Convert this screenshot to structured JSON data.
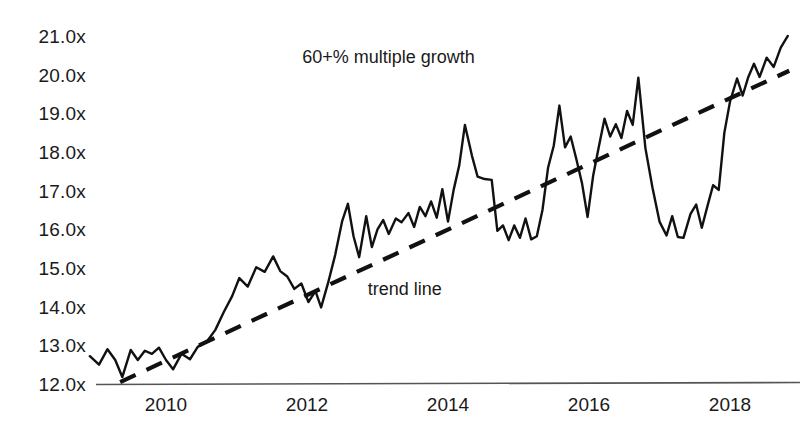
{
  "chart_data": {
    "type": "line",
    "title": "",
    "subtitle": "",
    "xlabel": "",
    "ylabel": "",
    "xlim": [
      2008.9,
      2018.95
    ],
    "ylim": [
      12.0,
      21.3
    ],
    "grid": false,
    "legend_position": "none",
    "y_tick_labels": [
      "21.0x",
      "20.0x",
      "19.0x",
      "18.0x",
      "17.0x",
      "16.0x",
      "15.0x",
      "14.0x",
      "13.0x",
      "12.0x"
    ],
    "y_tick_values": [
      21.0,
      20.0,
      19.0,
      18.0,
      17.0,
      16.0,
      15.0,
      14.0,
      13.0,
      12.0
    ],
    "x_tick_labels": [
      "2010",
      "2012",
      "2014",
      "2016",
      "2018"
    ],
    "x_tick_values": [
      2010,
      2012,
      2014,
      2016,
      2018
    ],
    "annotations": [
      {
        "name": "growth-annotation",
        "text": "60+% multiple growth",
        "x": 2013.35,
        "y": 20.45
      },
      {
        "name": "trendline-annotation",
        "text": "trend line",
        "x": 2013.5,
        "y": 14.45
      }
    ],
    "series": [
      {
        "name": "multiple",
        "style": "solid",
        "color": "#111111",
        "points": [
          [
            2008.92,
            12.72
          ],
          [
            2009.05,
            12.5
          ],
          [
            2009.17,
            12.9
          ],
          [
            2009.28,
            12.62
          ],
          [
            2009.38,
            12.18
          ],
          [
            2009.5,
            12.88
          ],
          [
            2009.6,
            12.62
          ],
          [
            2009.7,
            12.86
          ],
          [
            2009.8,
            12.78
          ],
          [
            2009.9,
            12.94
          ],
          [
            2010.0,
            12.62
          ],
          [
            2010.1,
            12.38
          ],
          [
            2010.22,
            12.78
          ],
          [
            2010.34,
            12.64
          ],
          [
            2010.45,
            12.96
          ],
          [
            2010.58,
            13.1
          ],
          [
            2010.7,
            13.4
          ],
          [
            2010.82,
            13.86
          ],
          [
            2010.94,
            14.28
          ],
          [
            2011.04,
            14.74
          ],
          [
            2011.16,
            14.52
          ],
          [
            2011.28,
            15.02
          ],
          [
            2011.4,
            14.9
          ],
          [
            2011.52,
            15.3
          ],
          [
            2011.62,
            14.92
          ],
          [
            2011.72,
            14.78
          ],
          [
            2011.82,
            14.46
          ],
          [
            2011.92,
            14.6
          ],
          [
            2012.02,
            14.12
          ],
          [
            2012.12,
            14.4
          ],
          [
            2012.2,
            13.98
          ],
          [
            2012.3,
            14.62
          ],
          [
            2012.4,
            15.34
          ],
          [
            2012.5,
            16.22
          ],
          [
            2012.58,
            16.66
          ],
          [
            2012.66,
            15.82
          ],
          [
            2012.74,
            15.28
          ],
          [
            2012.84,
            16.34
          ],
          [
            2012.92,
            15.54
          ],
          [
            2013.0,
            16.0
          ],
          [
            2013.08,
            16.24
          ],
          [
            2013.16,
            15.88
          ],
          [
            2013.26,
            16.28
          ],
          [
            2013.34,
            16.18
          ],
          [
            2013.44,
            16.42
          ],
          [
            2013.52,
            16.06
          ],
          [
            2013.6,
            16.58
          ],
          [
            2013.68,
            16.34
          ],
          [
            2013.76,
            16.72
          ],
          [
            2013.84,
            16.3
          ],
          [
            2013.92,
            17.04
          ],
          [
            2014.0,
            16.2
          ],
          [
            2014.08,
            17.02
          ],
          [
            2014.16,
            17.66
          ],
          [
            2014.24,
            18.7
          ],
          [
            2014.34,
            17.9
          ],
          [
            2014.42,
            17.36
          ],
          [
            2014.52,
            17.3
          ],
          [
            2014.62,
            17.28
          ],
          [
            2014.7,
            15.96
          ],
          [
            2014.78,
            16.1
          ],
          [
            2014.86,
            15.72
          ],
          [
            2014.94,
            16.1
          ],
          [
            2015.02,
            15.78
          ],
          [
            2015.1,
            16.28
          ],
          [
            2015.18,
            15.74
          ],
          [
            2015.26,
            15.82
          ],
          [
            2015.34,
            16.5
          ],
          [
            2015.42,
            17.6
          ],
          [
            2015.5,
            18.16
          ],
          [
            2015.58,
            19.2
          ],
          [
            2015.66,
            18.12
          ],
          [
            2015.74,
            18.4
          ],
          [
            2015.82,
            17.82
          ],
          [
            2015.9,
            17.2
          ],
          [
            2015.98,
            16.32
          ],
          [
            2016.06,
            17.4
          ],
          [
            2016.14,
            18.14
          ],
          [
            2016.22,
            18.86
          ],
          [
            2016.3,
            18.4
          ],
          [
            2016.38,
            18.72
          ],
          [
            2016.46,
            18.36
          ],
          [
            2016.54,
            19.06
          ],
          [
            2016.62,
            18.7
          ],
          [
            2016.7,
            19.92
          ],
          [
            2016.8,
            18.1
          ],
          [
            2016.9,
            17.08
          ],
          [
            2017.0,
            16.2
          ],
          [
            2017.1,
            15.84
          ],
          [
            2017.18,
            16.34
          ],
          [
            2017.26,
            15.8
          ],
          [
            2017.34,
            15.78
          ],
          [
            2017.44,
            16.4
          ],
          [
            2017.52,
            16.64
          ],
          [
            2017.6,
            16.04
          ],
          [
            2017.68,
            16.6
          ],
          [
            2017.76,
            17.14
          ],
          [
            2017.84,
            17.02
          ],
          [
            2017.92,
            18.5
          ],
          [
            2018.0,
            19.3
          ],
          [
            2018.1,
            19.9
          ],
          [
            2018.18,
            19.46
          ],
          [
            2018.26,
            19.94
          ],
          [
            2018.34,
            20.28
          ],
          [
            2018.42,
            19.94
          ],
          [
            2018.52,
            20.44
          ],
          [
            2018.62,
            20.2
          ],
          [
            2018.72,
            20.7
          ],
          [
            2018.82,
            21.0
          ]
        ]
      }
    ],
    "trend_line": {
      "name": "trend line",
      "style": "dashed",
      "color": "#111111",
      "start": [
        2009.35,
        12.05
      ],
      "end": [
        2018.84,
        20.1
      ]
    }
  }
}
